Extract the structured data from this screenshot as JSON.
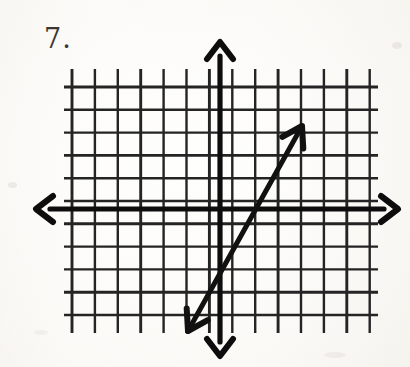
{
  "page": {
    "kind": "scanned-math-worksheet",
    "background_color": "#fbfaf7",
    "ink_color": "#1a1a1a",
    "width": 410,
    "height": 367
  },
  "problem": {
    "number_label": "7.",
    "label_x": 44,
    "label_y": 23
  },
  "chart_data": {
    "type": "line",
    "title": "",
    "subtitle": "",
    "xlabel": "",
    "ylabel": "",
    "grid": true,
    "grid_style": "graph-paper",
    "legend": "none",
    "axes": {
      "x_axis_label": "x-axis",
      "y_axis_label": "y-axis",
      "x_axis_arrowheads": "both",
      "y_axis_arrowheads": "both",
      "tick_labels_shown": false,
      "origin_cell_col": 6,
      "origin_cell_row": 5
    },
    "grid_geometry": {
      "left_px": 72,
      "top_px": 87,
      "right_px": 370,
      "bottom_px": 315,
      "columns": 13,
      "rows": 10,
      "cell_width_px": 22.9,
      "cell_height_px": 22.8,
      "tick_overhang_px": 18
    },
    "axis_geometry": {
      "x_axis_y_px": 209,
      "x_axis_left_tip_px": 36,
      "x_axis_right_tip_px": 398,
      "y_axis_x_px": 220,
      "y_axis_top_tip_px": 42,
      "y_axis_bottom_tip_px": 356
    },
    "series": [
      {
        "name": "plotted-line",
        "type": "line-with-double-arrowheads",
        "stroke_width_px": 5,
        "color": "#111111",
        "endpoints_px": [
          [
            188,
            331
          ],
          [
            302,
            126
          ]
        ],
        "x_intercept_px": 241,
        "slope_grid_units": 2,
        "y_intercept_grid_units": -2,
        "equation": "y = 2x - 2",
        "grid_points": [
          [
            -1,
            -4
          ],
          [
            0,
            -2
          ],
          [
            1,
            0
          ],
          [
            2,
            2
          ],
          [
            3,
            4
          ]
        ]
      }
    ],
    "xlim": [
      -6,
      7
    ],
    "ylim": [
      -5,
      5
    ]
  }
}
